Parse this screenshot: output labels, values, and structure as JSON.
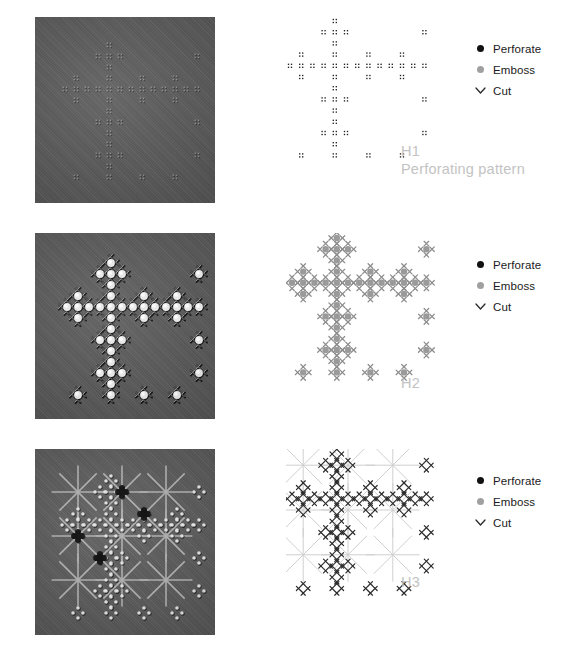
{
  "figure": {
    "background": "#ffffff",
    "width": 570,
    "height": 648
  },
  "legend_colors": {
    "perforate": "#111111",
    "emboss": "#a0a0a0",
    "cut": "#3b3b3b",
    "caption": "#c3c3c3",
    "guide_line": "#c9c9c9",
    "photo_base": "#575757"
  },
  "legend": {
    "perforate_label": "Perforate",
    "emboss_label": "Emboss",
    "cut_label": "Cut",
    "perforate_icon": "filled-circle-icon",
    "emboss_icon": "gray-circle-icon",
    "cut_icon": "chevron-down-icon"
  },
  "rows": [
    {
      "id": "H1",
      "code_label": "H1",
      "sub_label": "Perforating pattern",
      "photo_alt": "dark woven fabric with faint perforation pattern",
      "markers": {
        "perforate": true,
        "emboss": false,
        "cut": false,
        "guides": false
      }
    },
    {
      "id": "H2",
      "code_label": "H2",
      "sub_label": "",
      "photo_alt": "dark woven fabric with raised embossed bumps and cut marks",
      "markers": {
        "perforate": false,
        "emboss": true,
        "cut": true,
        "guides": false
      }
    },
    {
      "id": "H3",
      "code_label": "H3",
      "sub_label": "",
      "photo_alt": "dark woven fabric with black flower shaped cut holes and radiating guide lines",
      "markers": {
        "perforate": true,
        "emboss": false,
        "cut": true,
        "guides": true
      }
    }
  ],
  "chart_data": {
    "type": "scatter",
    "title": "Perforating pattern",
    "xlabel": "",
    "ylabel": "",
    "grid": false,
    "legend_position": "right",
    "categories": [
      "Perforate",
      "Emboss",
      "Cut"
    ],
    "series": [
      {
        "name": "H1 perforate cells",
        "marker": "perforate",
        "description": "Sierpinski-carpet style fractal grid of 2x2 micro dot clusters on a 13x13 cell lattice",
        "lattice": 13,
        "rule": "sierpinski-carpet-complement"
      },
      {
        "name": "H2 emboss cells",
        "marker": "emboss",
        "description": "Gray filled circles at fractal lattice nodes",
        "lattice": 13,
        "rule": "sierpinski-carpet-complement"
      },
      {
        "name": "H2 cut cells",
        "marker": "cut",
        "description": "Cut x-marks surrounding each emboss node in a plus formation",
        "lattice": 13,
        "rule": "neighbors-of-emboss"
      },
      {
        "name": "H3 cut cells",
        "marker": "cut",
        "description": "Dense x-mark field forming flower clusters with radiating star guide lines",
        "lattice": 13,
        "rule": "sierpinski-carpet-complement"
      }
    ]
  }
}
